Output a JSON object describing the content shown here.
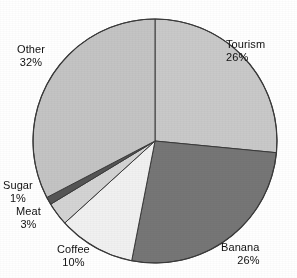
{
  "chart_data": {
    "type": "pie",
    "title": "",
    "subtitle": "",
    "xlabel": "",
    "ylabel": "",
    "legend_position": "none",
    "grid": false,
    "labels_show_percent": true,
    "start_angle_deg": 0,
    "direction": "clockwise",
    "categories": [
      "Tourism",
      "Banana",
      "Coffee",
      "Meat",
      "Sugar",
      "Other"
    ],
    "values": [
      26,
      26,
      10,
      3,
      1,
      32
    ],
    "units": "%",
    "slices": [
      {
        "name": "Tourism",
        "value": 26,
        "label": "Tourism",
        "percent_label": "26%",
        "color": "#c9c9c9"
      },
      {
        "name": "Banana",
        "value": 26,
        "label": "Banana",
        "percent_label": "26%",
        "color": "#767676"
      },
      {
        "name": "Coffee",
        "value": 10,
        "label": "Coffee",
        "percent_label": "10%",
        "color": "#f1f1f1"
      },
      {
        "name": "Meat",
        "value": 3,
        "label": "Meat",
        "percent_label": "3%",
        "color": "#d4d4d4"
      },
      {
        "name": "Sugar",
        "value": 1,
        "label": "Sugar",
        "percent_label": "1%",
        "color": "#555555"
      },
      {
        "name": "Other",
        "value": 32,
        "label": "Other",
        "percent_label": "32%",
        "color": "#c4c4c4"
      }
    ],
    "geometry": {
      "center_x": 155,
      "center_y": 141,
      "radius": 122
    },
    "style": {
      "background": "#ffffff",
      "outline_color": "#3a3a3a",
      "text_color": "#111111"
    }
  }
}
